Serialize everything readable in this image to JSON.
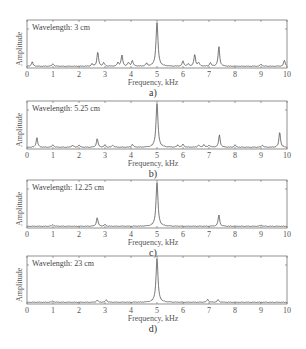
{
  "figure": {
    "panels": [
      {
        "id": "a",
        "caption": "a)",
        "legend": "Wavelength: 3 cm",
        "xlabel": "Frequency, kHz",
        "ylabel": "Amplitude"
      },
      {
        "id": "b",
        "caption": "b)",
        "legend": "Wavelength: 5.25 cm",
        "xlabel": "Frequency, kHz",
        "ylabel": "Amplitude"
      },
      {
        "id": "c",
        "caption": "c)",
        "legend": "Wavelength: 12.25 cm",
        "xlabel": "Frequency, kHz",
        "ylabel": "Amplitude"
      },
      {
        "id": "d",
        "caption": "d)",
        "legend": "Wavelength: 23 cm",
        "xlabel": "Frequency, kHz",
        "ylabel": "Amplitude"
      }
    ],
    "xticks": [
      "0",
      "1",
      "2",
      "3",
      "4",
      "5",
      "6",
      "7",
      "8",
      "9",
      "10"
    ],
    "line_color": "#555555",
    "axis_color": "#777777"
  },
  "chart_data": [
    {
      "type": "line",
      "title": "Wavelength: 3 cm",
      "caption": "a)",
      "xlabel": "Frequency, kHz",
      "ylabel": "Amplitude",
      "xlim": [
        0,
        10
      ],
      "ylim": [
        0,
        1
      ],
      "grid": false,
      "legend_position": "upper left",
      "peaks": [
        {
          "x": 0.2,
          "y": 0.1
        },
        {
          "x": 1.0,
          "y": 0.06
        },
        {
          "x": 2.5,
          "y": 0.05
        },
        {
          "x": 2.72,
          "y": 0.33
        },
        {
          "x": 2.95,
          "y": 0.08
        },
        {
          "x": 3.5,
          "y": 0.08
        },
        {
          "x": 3.65,
          "y": 0.25
        },
        {
          "x": 3.9,
          "y": 0.08
        },
        {
          "x": 4.05,
          "y": 0.13
        },
        {
          "x": 4.6,
          "y": 0.06
        },
        {
          "x": 5.0,
          "y": 1.0
        },
        {
          "x": 6.0,
          "y": 0.12
        },
        {
          "x": 6.2,
          "y": 0.05
        },
        {
          "x": 6.45,
          "y": 0.27
        },
        {
          "x": 6.6,
          "y": 0.08
        },
        {
          "x": 7.05,
          "y": 0.08
        },
        {
          "x": 7.38,
          "y": 0.45
        },
        {
          "x": 9.0,
          "y": 0.05
        },
        {
          "x": 9.9,
          "y": 0.14
        }
      ]
    },
    {
      "type": "line",
      "title": "Wavelength: 5.25 cm",
      "caption": "b)",
      "xlabel": "Frequency, kHz",
      "ylabel": "Amplitude",
      "xlim": [
        0,
        10
      ],
      "ylim": [
        0,
        1
      ],
      "grid": false,
      "legend_position": "upper left",
      "peaks": [
        {
          "x": 0.38,
          "y": 0.22
        },
        {
          "x": 1.0,
          "y": 0.06
        },
        {
          "x": 1.75,
          "y": 0.05
        },
        {
          "x": 2.0,
          "y": 0.05
        },
        {
          "x": 2.7,
          "y": 0.2
        },
        {
          "x": 3.0,
          "y": 0.05
        },
        {
          "x": 3.3,
          "y": 0.05
        },
        {
          "x": 4.05,
          "y": 0.07
        },
        {
          "x": 5.0,
          "y": 1.0
        },
        {
          "x": 5.8,
          "y": 0.05
        },
        {
          "x": 6.0,
          "y": 0.07
        },
        {
          "x": 6.6,
          "y": 0.05
        },
        {
          "x": 6.8,
          "y": 0.06
        },
        {
          "x": 7.0,
          "y": 0.05
        },
        {
          "x": 7.4,
          "y": 0.28
        },
        {
          "x": 8.0,
          "y": 0.05
        },
        {
          "x": 9.05,
          "y": 0.05
        },
        {
          "x": 9.72,
          "y": 0.35
        }
      ]
    },
    {
      "type": "line",
      "title": "Wavelength: 12.25 cm",
      "caption": "c)",
      "xlabel": "Frequency, kHz",
      "ylabel": "Amplitude",
      "xlim": [
        0,
        10
      ],
      "ylim": [
        0,
        1
      ],
      "grid": false,
      "legend_position": "upper left",
      "peaks": [
        {
          "x": 1.0,
          "y": 0.04
        },
        {
          "x": 2.7,
          "y": 0.2
        },
        {
          "x": 3.0,
          "y": 0.04
        },
        {
          "x": 5.0,
          "y": 1.0
        },
        {
          "x": 7.38,
          "y": 0.26
        },
        {
          "x": 9.0,
          "y": 0.03
        }
      ]
    },
    {
      "type": "line",
      "title": "Wavelength: 23 cm",
      "caption": "d)",
      "xlabel": "Frequency, kHz",
      "ylabel": "Amplitude",
      "xlim": [
        0,
        10
      ],
      "ylim": [
        0,
        1
      ],
      "grid": false,
      "legend_position": "upper left",
      "peaks": [
        {
          "x": 1.0,
          "y": 0.03
        },
        {
          "x": 2.7,
          "y": 0.05
        },
        {
          "x": 3.05,
          "y": 0.06
        },
        {
          "x": 5.0,
          "y": 1.0
        },
        {
          "x": 6.95,
          "y": 0.07
        },
        {
          "x": 7.35,
          "y": 0.06
        }
      ]
    }
  ]
}
